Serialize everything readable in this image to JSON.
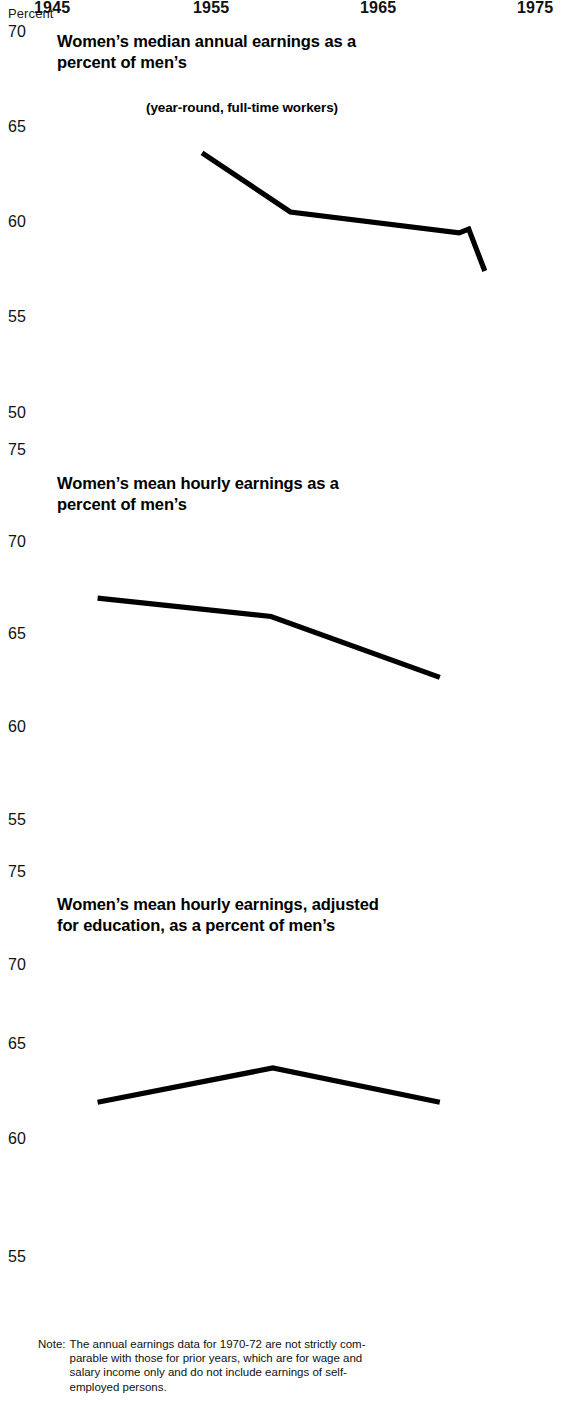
{
  "axis_unit_label": "Percent",
  "panels": [
    {
      "id": "median-annual",
      "title_line1": "Women’s median annual earnings as a",
      "title_line2": "percent of men’s",
      "subtitle": "(year-round, full-time workers)",
      "yticks": [
        "70",
        "65",
        "60",
        "55",
        "50"
      ]
    },
    {
      "id": "mean-hourly",
      "title_line1": "Women’s mean hourly earnings as a",
      "title_line2": "percent of men’s",
      "subtitle": "",
      "yticks": [
        "75",
        "70",
        "65",
        "60",
        "55"
      ]
    },
    {
      "id": "mean-hourly-adjusted",
      "title_line1": "Women’s mean hourly earnings, adjusted",
      "title_line2": "for education, as a percent of men’s",
      "subtitle": "",
      "yticks": [
        "75",
        "70",
        "65",
        "60",
        "55"
      ]
    }
  ],
  "xticks": [
    "1945",
    "1955",
    "1965",
    "1975"
  ],
  "note": {
    "label": "Note:",
    "line1": "The annual earnings data for 1970-72 are not strictly com-",
    "line2": "parable with those for prior years, which are for wage and",
    "line3": "salary income only and do not include earnings of self-",
    "line4": "employed persons."
  },
  "chart_data": [
    {
      "type": "line",
      "title": "Women’s median annual earnings as a percent of men’s",
      "subtitle": "(year-round, full-time workers)",
      "xlabel": "",
      "ylabel": "Percent",
      "xlim": [
        1945,
        1975
      ],
      "ylim": [
        50,
        70
      ],
      "grid": false,
      "legend": "none",
      "yticks": [
        50,
        55,
        60,
        65,
        70
      ],
      "xticks": [
        1945,
        1955,
        1965,
        1975
      ],
      "series": [
        {
          "name": "Women's median annual earnings as percent of men's",
          "x": [
            1954.4,
            1959.9,
            1970.4,
            1971.0,
            1972.0
          ],
          "values": [
            63.6,
            60.5,
            59.4,
            59.6,
            57.4
          ]
        }
      ]
    },
    {
      "type": "line",
      "title": "Women’s mean hourly earnings as a percent of men’s",
      "subtitle": "",
      "xlabel": "",
      "ylabel": "Percent",
      "xlim": [
        1945,
        1975
      ],
      "ylim": [
        55,
        75
      ],
      "grid": false,
      "legend": "none",
      "yticks": [
        55,
        60,
        65,
        70,
        75
      ],
      "xticks": [
        1945,
        1955,
        1965,
        1975
      ],
      "series": [
        {
          "name": "Women's mean hourly earnings as percent of men's",
          "x": [
            1947.9,
            1958.7,
            1969.2
          ],
          "values": [
            67.3,
            66.3,
            63.0
          ]
        }
      ]
    },
    {
      "type": "line",
      "title": "Women’s mean hourly earnings, adjusted for education, as a percent of men’s",
      "subtitle": "",
      "xlabel": "",
      "ylabel": "Percent",
      "xlim": [
        1945,
        1975
      ],
      "ylim": [
        55,
        75
      ],
      "grid": false,
      "legend": "none",
      "yticks": [
        55,
        60,
        65,
        70,
        75
      ],
      "xticks": [
        1945,
        1955,
        1965,
        1975
      ],
      "series": [
        {
          "name": "Women's mean hourly earnings adjusted for education as percent of men's",
          "x": [
            1947.9,
            1958.8,
            1969.2
          ],
          "values": [
            63.2,
            65.0,
            63.2
          ]
        }
      ]
    }
  ]
}
